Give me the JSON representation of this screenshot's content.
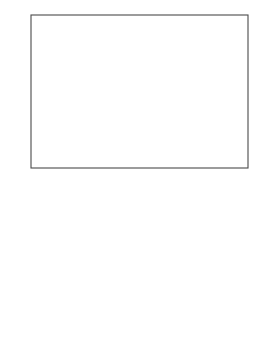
{
  "figure": {
    "axis_y_label": "β",
    "axis_x_label_base": "log m",
    "axis_x_label_sup": "f",
    "axis_x_label_sub": "D",
    "panel_a_label": "a",
    "panel_b_label": "b"
  },
  "chart_data": [
    {
      "type": "line",
      "panel": "a",
      "title": "",
      "xlabel": "log m_D^f",
      "ylabel": "β",
      "xlim": [
        -4.95,
        -3.15
      ],
      "ylim": [
        -0.02,
        1.18
      ],
      "xticks": [
        -4.5,
        -3.5
      ],
      "xtick_labels": [
        "-4.5",
        "-3.5"
      ],
      "yticks": [
        0.5,
        1.0
      ],
      "ytick_labels": [
        "0.5",
        "1.0"
      ],
      "grid": false,
      "legend": "inline-curve-numbers",
      "series": [
        {
          "name": "f",
          "label": "f",
          "marker": "filled-circle",
          "label_x": -4.78,
          "label_y": 0.58,
          "x": [
            -4.93,
            -4.9,
            -4.87,
            -4.85,
            -4.83,
            -4.81,
            -4.79,
            -4.775,
            -4.765,
            -4.755,
            -4.745,
            -4.735,
            -4.725,
            -4.715,
            -4.705,
            -4.695,
            -4.685,
            -4.675,
            -4.665,
            -4.655,
            -4.64,
            -4.62,
            -4.6,
            -4.57,
            -4.54,
            -4.5,
            -4.45,
            -4.39,
            -4.32,
            -4.24,
            -4.15,
            -4.05,
            -3.95,
            -3.86
          ],
          "y": [
            0.01,
            0.012,
            0.016,
            0.02,
            0.026,
            0.034,
            0.046,
            0.06,
            0.085,
            0.13,
            0.2,
            0.3,
            0.4,
            0.48,
            0.545,
            0.6,
            0.645,
            0.685,
            0.72,
            0.75,
            0.785,
            0.825,
            0.855,
            0.89,
            0.915,
            0.94,
            0.965,
            0.985,
            1.0,
            1.015,
            1.03,
            1.04,
            1.05,
            1.055
          ]
        },
        {
          "name": "1",
          "label": "1",
          "marker": "filled-circle",
          "label_x": -4.26,
          "label_y": 0.58,
          "x": [
            -4.62,
            -4.55,
            -4.5,
            -4.46,
            -4.43,
            -4.405,
            -4.385,
            -4.37,
            -4.358,
            -4.348,
            -4.34,
            -4.333,
            -4.327,
            -4.322,
            -4.317,
            -4.312,
            -4.307,
            -4.302,
            -4.296,
            -4.29,
            -4.283,
            -4.275,
            -4.266,
            -4.255,
            -4.242,
            -4.227,
            -4.21,
            -4.19,
            -4.165,
            -4.135,
            -4.1,
            -4.06,
            -4.01,
            -3.96,
            -3.9,
            -3.84
          ],
          "y": [
            0.008,
            0.009,
            0.01,
            0.012,
            0.014,
            0.016,
            0.019,
            0.024,
            0.035,
            0.06,
            0.1,
            0.16,
            0.23,
            0.3,
            0.37,
            0.435,
            0.49,
            0.54,
            0.59,
            0.635,
            0.68,
            0.72,
            0.76,
            0.8,
            0.835,
            0.865,
            0.89,
            0.915,
            0.935,
            0.955,
            0.975,
            0.99,
            1.005,
            1.02,
            1.035,
            1.05
          ]
        },
        {
          "name": "2",
          "label": "2",
          "marker": "open-circle",
          "label_x": -4.1,
          "label_y": 0.58,
          "x": [
            -4.31,
            -4.295,
            -4.283,
            -4.272,
            -4.263,
            -4.255,
            -4.248,
            -4.241,
            -4.234,
            -4.227,
            -4.22,
            -4.212,
            -4.203,
            -4.193,
            -4.182,
            -4.17,
            -4.156,
            -4.14,
            -4.122,
            -4.1,
            -4.076,
            -4.05,
            -4.02,
            -3.99,
            -3.955,
            -3.92,
            -3.885,
            -3.85,
            -3.815,
            -3.78,
            -3.745,
            -3.71
          ],
          "y": [
            0.008,
            0.012,
            0.02,
            0.04,
            0.075,
            0.125,
            0.185,
            0.25,
            0.315,
            0.375,
            0.43,
            0.485,
            0.535,
            0.585,
            0.63,
            0.67,
            0.71,
            0.745,
            0.78,
            0.81,
            0.84,
            0.865,
            0.89,
            0.91,
            0.93,
            0.95,
            0.965,
            0.98,
            0.995,
            1.01,
            1.025,
            1.04
          ]
        },
        {
          "name": "3",
          "label": "3",
          "marker": "filled-circle",
          "label_x": -3.87,
          "label_y": 0.58,
          "x": [
            -4.2,
            -4.175,
            -4.155,
            -4.138,
            -4.122,
            -4.108,
            -4.095,
            -4.083,
            -4.071,
            -4.059,
            -4.047,
            -4.035,
            -4.022,
            -4.008,
            -3.993,
            -3.977,
            -3.96,
            -3.942,
            -3.922,
            -3.9,
            -3.877,
            -3.852,
            -3.826,
            -3.8,
            -3.772,
            -3.743,
            -3.713,
            -3.683,
            -3.652,
            -3.62,
            -3.588,
            -3.555,
            -3.522
          ],
          "y": [
            0.008,
            0.01,
            0.014,
            0.02,
            0.03,
            0.05,
            0.08,
            0.12,
            0.165,
            0.21,
            0.255,
            0.3,
            0.345,
            0.39,
            0.435,
            0.478,
            0.52,
            0.56,
            0.6,
            0.64,
            0.68,
            0.715,
            0.75,
            0.785,
            0.82,
            0.855,
            0.885,
            0.915,
            0.945,
            0.975,
            1.0,
            1.03,
            1.055
          ]
        },
        {
          "name": "4",
          "label": "4",
          "marker": "open-circle",
          "label_x": -3.68,
          "label_y": 0.58,
          "x": [
            -4.0,
            -3.98,
            -3.962,
            -3.946,
            -3.931,
            -3.917,
            -3.903,
            -3.889,
            -3.875,
            -3.861,
            -3.846,
            -3.831,
            -3.815,
            -3.798,
            -3.78,
            -3.761,
            -3.741,
            -3.72,
            -3.698,
            -3.675,
            -3.651,
            -3.626,
            -3.6,
            -3.573,
            -3.545,
            -3.516,
            -3.486,
            -3.455,
            -3.423,
            -3.39,
            -3.356,
            -3.322
          ],
          "y": [
            0.008,
            0.01,
            0.014,
            0.02,
            0.03,
            0.047,
            0.07,
            0.1,
            0.135,
            0.175,
            0.215,
            0.255,
            0.295,
            0.335,
            0.375,
            0.415,
            0.455,
            0.495,
            0.535,
            0.575,
            0.615,
            0.655,
            0.695,
            0.735,
            0.775,
            0.815,
            0.855,
            0.89,
            0.925,
            0.96,
            0.99,
            1.02
          ]
        }
      ]
    },
    {
      "type": "line",
      "panel": "b",
      "title": "",
      "xlabel": "log m_D^f",
      "ylabel": "β",
      "xlim": [
        -4.95,
        -3.15
      ],
      "ylim": [
        -0.02,
        1.18
      ],
      "xticks": [
        -4.5,
        -3.5
      ],
      "xtick_labels": [
        "-4.5",
        "-3.5"
      ],
      "yticks": [
        0.5,
        1.0
      ],
      "ytick_labels": [
        "0.5",
        "1.0"
      ],
      "grid": false,
      "legend": "inline-curve-numbers",
      "series": [
        {
          "name": "1",
          "label": "1",
          "marker": "filled-circle",
          "label_x": -4.06,
          "label_y": 0.6,
          "x": [
            -4.03,
            -4.025,
            -4.02,
            -4.014,
            -4.008,
            -4.002,
            -3.996,
            -3.99,
            -3.984,
            -3.977,
            -3.97,
            -3.962,
            -3.954,
            -3.945,
            -3.936,
            -3.926,
            -3.915,
            -3.903,
            -3.89,
            -3.876,
            -3.861,
            -3.845,
            -3.827,
            -3.808,
            -3.787,
            -3.764,
            -3.739,
            -3.712,
            -3.683,
            -3.652,
            -3.62
          ],
          "y": [
            0.008,
            0.012,
            0.02,
            0.035,
            0.06,
            0.1,
            0.15,
            0.205,
            0.26,
            0.315,
            0.37,
            0.42,
            0.47,
            0.515,
            0.56,
            0.6,
            0.64,
            0.68,
            0.715,
            0.75,
            0.785,
            0.815,
            0.845,
            0.875,
            0.9,
            0.925,
            0.95,
            0.975,
            1.0,
            1.03,
            1.06
          ]
        },
        {
          "name": "2",
          "label": "2",
          "marker": "open-circle",
          "label_x": -3.88,
          "label_y": 0.6,
          "x": [
            -4.0,
            -3.993,
            -3.986,
            -3.979,
            -3.971,
            -3.963,
            -3.955,
            -3.946,
            -3.937,
            -3.927,
            -3.917,
            -3.906,
            -3.894,
            -3.881,
            -3.867,
            -3.852,
            -3.836,
            -3.819,
            -3.8,
            -3.78,
            -3.758,
            -3.735,
            -3.71,
            -3.684,
            -3.656,
            -3.627,
            -3.597,
            -3.566,
            -3.534,
            -3.5,
            -3.466
          ],
          "y": [
            0.008,
            0.012,
            0.022,
            0.04,
            0.07,
            0.11,
            0.155,
            0.205,
            0.255,
            0.305,
            0.355,
            0.4,
            0.445,
            0.49,
            0.53,
            0.57,
            0.61,
            0.65,
            0.685,
            0.72,
            0.755,
            0.785,
            0.815,
            0.845,
            0.875,
            0.9,
            0.93,
            0.955,
            0.985,
            1.01,
            1.04
          ]
        },
        {
          "name": "3",
          "label": "3",
          "marker": "filled-triangle",
          "label_x": -3.7,
          "label_y": 0.6,
          "x": [
            -3.86,
            -3.845,
            -3.83,
            -3.815,
            -3.8,
            -3.785,
            -3.77,
            -3.754,
            -3.738,
            -3.721,
            -3.704,
            -3.686,
            -3.667,
            -3.647,
            -3.626,
            -3.604,
            -3.581,
            -3.557,
            -3.532,
            -3.506,
            -3.479,
            -3.451,
            -3.422,
            -3.392,
            -3.361,
            -3.33
          ],
          "y": [
            0.008,
            0.012,
            0.022,
            0.04,
            0.065,
            0.1,
            0.14,
            0.185,
            0.23,
            0.275,
            0.32,
            0.365,
            0.41,
            0.455,
            0.5,
            0.545,
            0.59,
            0.635,
            0.68,
            0.725,
            0.77,
            0.815,
            0.86,
            0.905,
            0.95,
            0.995
          ]
        },
        {
          "name": "4",
          "label": "4",
          "marker": "open-circle",
          "label_x": -3.57,
          "label_y": 0.6,
          "x": [
            -3.68,
            -3.665,
            -3.65,
            -3.635,
            -3.62,
            -3.604,
            -3.588,
            -3.571,
            -3.554,
            -3.536,
            -3.517,
            -3.498,
            -3.478,
            -3.457,
            -3.435,
            -3.413,
            -3.39,
            -3.366,
            -3.341,
            -3.316,
            -3.29,
            -3.264,
            -3.237,
            -3.21
          ],
          "y": [
            0.008,
            0.013,
            0.025,
            0.045,
            0.075,
            0.115,
            0.16,
            0.21,
            0.26,
            0.315,
            0.37,
            0.425,
            0.48,
            0.535,
            0.59,
            0.645,
            0.7,
            0.755,
            0.81,
            0.865,
            0.915,
            0.965,
            1.01,
            1.055
          ]
        }
      ]
    }
  ]
}
